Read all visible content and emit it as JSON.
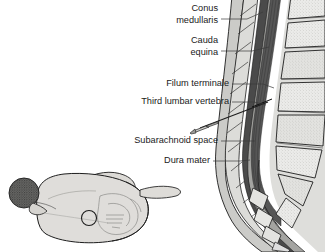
{
  "figure": {
    "background_color": "#ffffff",
    "width": 325,
    "height": 252
  },
  "labels": [
    {
      "id": "conus-medullaris",
      "lines": [
        "Conus",
        "medullaris"
      ],
      "text": "Conus medullaris",
      "x": 218,
      "y": 13,
      "leader": "M221,19 L246,19 L262,12"
    },
    {
      "id": "cauda-equina",
      "lines": [
        "Cauda",
        "equina"
      ],
      "text": "Cauda equina",
      "x": 218,
      "y": 45,
      "leader": "M221,51 L250,51 L268,48"
    },
    {
      "id": "filum-terminale",
      "lines": [
        "Filum terminale"
      ],
      "text": "Filum terminale",
      "x": 229,
      "y": 84,
      "leader": "M232,84 L262,84 L272,88"
    },
    {
      "id": "third-lumbar-vertebra",
      "lines": [
        "Third lumbar vertebra"
      ],
      "text": "Third lumbar vertebra",
      "x": 229,
      "y": 102,
      "leader": "M232,102 L252,102 L264,106"
    },
    {
      "id": "subarachnoid-space",
      "lines": [
        "Subarachnoid space"
      ],
      "text": "Subarachnoid space",
      "x": 218,
      "y": 141,
      "leader": "M221,141 L244,141 L253,141"
    },
    {
      "id": "dura-mater",
      "lines": [
        "Dura mater"
      ],
      "text": "Dura mater",
      "x": 210,
      "y": 161,
      "leader": "M213,161 L238,161 L248,160"
    }
  ],
  "anatomy": {
    "spine": {
      "name": "lumbar-spine-sagittal-section",
      "vertebral_body_color": "#e9e9e7",
      "spinous_process_color": "#d8d8d6",
      "dura_color": "#4a4a4a",
      "subarachnoid_color": "#9b9b9b",
      "cord_color": "#3a3a3a",
      "soft_tissue_color": "#c9c9c6",
      "outline_color": "#1d1d1d"
    },
    "needle": {
      "name": "spinal-needle",
      "hub_color": "#cfcfcc",
      "shaft_color": "#1d1d1d"
    },
    "patient": {
      "name": "patient-curled-lateral-position",
      "skin_color": "#dedcd8",
      "hair_color": "#4d4d4d",
      "outline_color": "#1d1d1d",
      "puncture_site_marker": "circle"
    }
  }
}
